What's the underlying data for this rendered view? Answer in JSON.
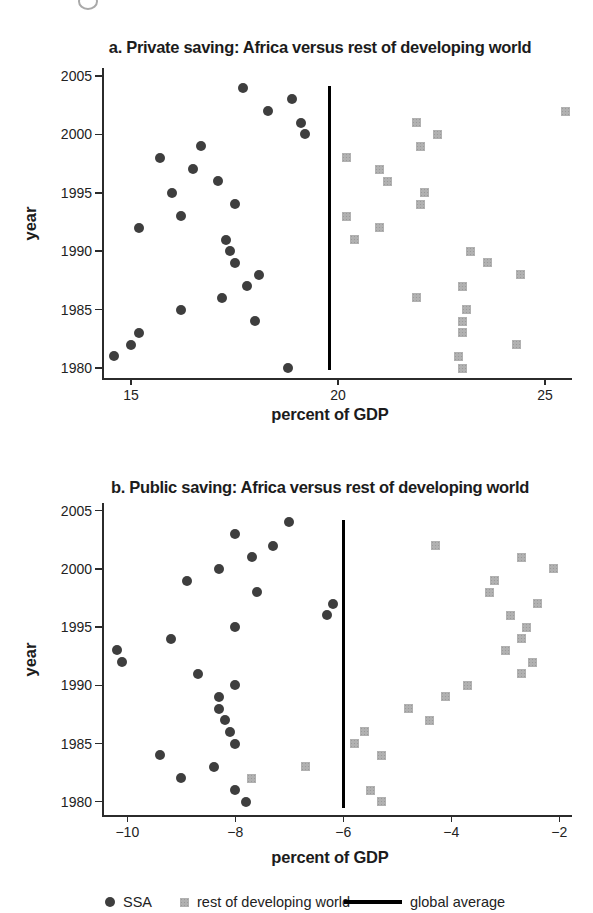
{
  "legend": {
    "ssa_label": "SSA",
    "rest_label": "rest of developing world",
    "global_label": "global average"
  },
  "colors": {
    "ssa_marker": "#3e3e3e",
    "rest_marker": "#b1b1b1",
    "global_line": "#000000",
    "axis": "#2b2b2b"
  },
  "chart_data": [
    {
      "type": "scatter",
      "title": "a. Private saving: Africa versus rest of developing world",
      "xlabel": "percent of GDP",
      "ylabel": "year",
      "xlim": [
        14,
        26
      ],
      "ylim": [
        1979,
        2006
      ],
      "grid": false,
      "x_ticks": [
        {
          "v": 15,
          "label": "15"
        },
        {
          "v": 20,
          "label": "20"
        },
        {
          "v": 25,
          "label": "25"
        }
      ],
      "y_ticks": [
        {
          "v": 1980,
          "label": "1980"
        },
        {
          "v": 1985,
          "label": "1985"
        },
        {
          "v": 1990,
          "label": "1990"
        },
        {
          "v": 1995,
          "label": "1995"
        },
        {
          "v": 2000,
          "label": "2000"
        },
        {
          "v": 2005,
          "label": "2005"
        }
      ],
      "global_average": 19.8,
      "series": [
        {
          "name": "SSA",
          "marker": "circle",
          "color": "#3e3e3e",
          "points": [
            [
              1980,
              18.8
            ],
            [
              1981,
              14.6
            ],
            [
              1982,
              15.0
            ],
            [
              1983,
              15.2
            ],
            [
              1984,
              18.0
            ],
            [
              1985,
              16.2
            ],
            [
              1986,
              17.2
            ],
            [
              1987,
              17.8
            ],
            [
              1988,
              18.1
            ],
            [
              1989,
              17.5
            ],
            [
              1990,
              17.4
            ],
            [
              1991,
              17.3
            ],
            [
              1992,
              15.2
            ],
            [
              1993,
              16.2
            ],
            [
              1994,
              17.5
            ],
            [
              1995,
              16.0
            ],
            [
              1996,
              17.1
            ],
            [
              1997,
              16.5
            ],
            [
              1998,
              15.7
            ],
            [
              1999,
              16.7
            ],
            [
              2000,
              19.2
            ],
            [
              2001,
              19.1
            ],
            [
              2002,
              18.3
            ],
            [
              2003,
              18.9
            ],
            [
              2004,
              17.7
            ]
          ]
        },
        {
          "name": "rest of developing world",
          "marker": "square",
          "color": "#b1b1b1",
          "points": [
            [
              1980,
              23.0
            ],
            [
              1981,
              22.9
            ],
            [
              1982,
              24.3
            ],
            [
              1983,
              23.0
            ],
            [
              1984,
              23.0
            ],
            [
              1985,
              23.1
            ],
            [
              1986,
              21.9
            ],
            [
              1987,
              23.0
            ],
            [
              1988,
              24.4
            ],
            [
              1989,
              23.6
            ],
            [
              1990,
              23.2
            ],
            [
              1991,
              20.4
            ],
            [
              1992,
              21.0
            ],
            [
              1993,
              20.2
            ],
            [
              1994,
              22.0
            ],
            [
              1995,
              22.1
            ],
            [
              1996,
              21.2
            ],
            [
              1997,
              21.0
            ],
            [
              1998,
              20.2
            ],
            [
              1999,
              22.0
            ],
            [
              2000,
              22.4
            ],
            [
              2001,
              21.9
            ],
            [
              2002,
              25.5
            ]
          ]
        }
      ]
    },
    {
      "type": "scatter",
      "title": "b. Public saving: Africa versus rest of developing world",
      "xlabel": "percent of GDP",
      "ylabel": "year",
      "xlim": [
        -10.5,
        -1.5
      ],
      "ylim": [
        1979,
        2006
      ],
      "grid": false,
      "x_ticks": [
        {
          "v": -10,
          "label": "−10"
        },
        {
          "v": -8,
          "label": "−8"
        },
        {
          "v": -6,
          "label": "−6"
        },
        {
          "v": -4,
          "label": "−4"
        },
        {
          "v": -2,
          "label": "−2"
        }
      ],
      "y_ticks": [
        {
          "v": 1980,
          "label": "1980"
        },
        {
          "v": 1985,
          "label": "1985"
        },
        {
          "v": 1990,
          "label": "1990"
        },
        {
          "v": 1995,
          "label": "1995"
        },
        {
          "v": 2000,
          "label": "2000"
        },
        {
          "v": 2005,
          "label": "2005"
        }
      ],
      "global_average": -6.0,
      "series": [
        {
          "name": "SSA",
          "marker": "circle",
          "color": "#3e3e3e",
          "points": [
            [
              1980,
              -7.8
            ],
            [
              1981,
              -8.0
            ],
            [
              1982,
              -9.0
            ],
            [
              1983,
              -8.4
            ],
            [
              1984,
              -9.4
            ],
            [
              1985,
              -8.0
            ],
            [
              1986,
              -8.1
            ],
            [
              1987,
              -8.2
            ],
            [
              1988,
              -8.3
            ],
            [
              1989,
              -8.3
            ],
            [
              1990,
              -8.0
            ],
            [
              1991,
              -8.7
            ],
            [
              1992,
              -10.1
            ],
            [
              1993,
              -10.2
            ],
            [
              1994,
              -9.2
            ],
            [
              1995,
              -8.0
            ],
            [
              1996,
              -6.3
            ],
            [
              1997,
              -6.2
            ],
            [
              1998,
              -7.6
            ],
            [
              1999,
              -8.9
            ],
            [
              2000,
              -8.3
            ],
            [
              2001,
              -7.7
            ],
            [
              2002,
              -7.3
            ],
            [
              2003,
              -8.0
            ],
            [
              2004,
              -7.0
            ]
          ]
        },
        {
          "name": "rest of developing world",
          "marker": "square",
          "color": "#b1b1b1",
          "points": [
            [
              1980,
              -5.3
            ],
            [
              1981,
              -5.5
            ],
            [
              1982,
              -7.7
            ],
            [
              1983,
              -6.7
            ],
            [
              1984,
              -5.3
            ],
            [
              1985,
              -5.8
            ],
            [
              1986,
              -5.6
            ],
            [
              1987,
              -4.4
            ],
            [
              1988,
              -4.8
            ],
            [
              1989,
              -4.1
            ],
            [
              1990,
              -3.7
            ],
            [
              1991,
              -2.7
            ],
            [
              1992,
              -2.5
            ],
            [
              1993,
              -3.0
            ],
            [
              1994,
              -2.7
            ],
            [
              1995,
              -2.6
            ],
            [
              1996,
              -2.9
            ],
            [
              1997,
              -2.4
            ],
            [
              1998,
              -3.3
            ],
            [
              1999,
              -3.2
            ],
            [
              2000,
              -2.1
            ],
            [
              2001,
              -2.7
            ],
            [
              2002,
              -4.3
            ]
          ]
        }
      ]
    }
  ]
}
